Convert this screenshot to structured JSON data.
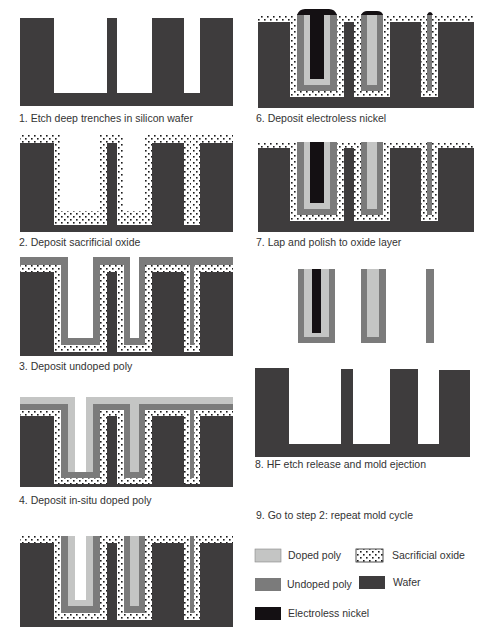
{
  "colors": {
    "wafer": "#3e3c3d",
    "undoped_poly": "#7b7b7b",
    "doped_poly": "#c4c5c4",
    "nickel": "#141013",
    "oxide_bg": "#ffffff",
    "oxide_dot": "#1a1a1a"
  },
  "steps": [
    {
      "id": 1,
      "caption": "1. Etch deep trenches in silicon wafer"
    },
    {
      "id": 2,
      "caption": "2. Deposit sacrificial oxide"
    },
    {
      "id": 3,
      "caption": "3. Deposit undoped poly"
    },
    {
      "id": 4,
      "caption": "4. Deposit in-situ doped poly"
    },
    {
      "id": 5,
      "caption": ""
    },
    {
      "id": 6,
      "caption": "6. Deposit electroless nickel"
    },
    {
      "id": 7,
      "caption": "7. Lap and polish to oxide layer"
    },
    {
      "id": 8,
      "caption": "8. HF etch release and mold ejection"
    },
    {
      "id": 9,
      "caption": "9. Go to step 2: repeat mold cycle"
    }
  ],
  "legend": [
    {
      "key": "doped_poly",
      "label": "Doped poly"
    },
    {
      "key": "undoped_poly",
      "label": "Undoped poly"
    },
    {
      "key": "nickel",
      "label": "Electroless nickel"
    },
    {
      "key": "oxide",
      "label": "Sacrificial oxide"
    },
    {
      "key": "wafer",
      "label": "Wafer"
    }
  ]
}
